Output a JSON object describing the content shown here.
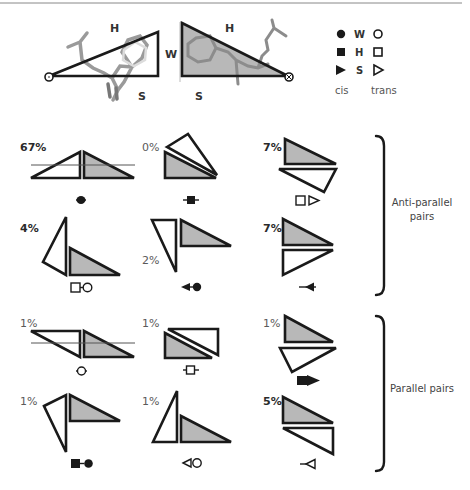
{
  "header": {
    "edge_labels": {
      "left_triangle": {
        "hypotenuse": "H",
        "vertical": "W",
        "base": "S"
      },
      "right_triangle": {
        "hypotenuse": "H",
        "vertical": "W",
        "base": "S"
      }
    }
  },
  "legend": {
    "rows": [
      {
        "edge": "W",
        "cis_symbol": "filled-circle",
        "trans_symbol": "open-circle"
      },
      {
        "edge": "H",
        "cis_symbol": "filled-square",
        "trans_symbol": "open-square"
      },
      {
        "edge": "S",
        "cis_symbol": "filled-triangle",
        "trans_symbol": "open-triangle"
      }
    ],
    "cis_label": "cis",
    "trans_label": "trans"
  },
  "groups": {
    "anti_parallel": {
      "label_line1": "Anti-parallel",
      "label_line2": "pairs",
      "cells": [
        {
          "percent": "67%",
          "bold": true,
          "symbol": "cis W/W (filled circle)"
        },
        {
          "percent": "0%",
          "bold": false,
          "symbol": "cis H/H (filled square)"
        },
        {
          "percent": "7%",
          "bold": true,
          "symbol": "trans H/S (open square + open triangle)"
        },
        {
          "percent": "4%",
          "bold": true,
          "symbol": "trans H/W (open square + open circle)"
        },
        {
          "percent": "2%",
          "bold": false,
          "symbol": "cis S/W (filled triangle + filled circle)"
        },
        {
          "percent": "7%",
          "bold": true,
          "symbol": "cis S/S (filled triangle)"
        }
      ]
    },
    "parallel": {
      "label": "Parallel pairs",
      "cells": [
        {
          "percent": "1%",
          "bold": false,
          "symbol": "trans W/W (open circle)"
        },
        {
          "percent": "1%",
          "bold": false,
          "symbol": "trans H/H (open square)"
        },
        {
          "percent": "1%",
          "bold": false,
          "symbol": "cis H/S (filled square + filled triangle)"
        },
        {
          "percent": "1%",
          "bold": false,
          "symbol": "cis H/W (filled square + filled circle)"
        },
        {
          "percent": "1%",
          "bold": false,
          "symbol": "trans S/W (open triangle + open circle)"
        },
        {
          "percent": "5%",
          "bold": true,
          "symbol": "trans S/S (open triangle)"
        }
      ]
    }
  },
  "colors": {
    "stroke": "#1a1a1a",
    "fill_grey": "#b8b8b8",
    "fill_white": "#ffffff",
    "rule": "#888888"
  }
}
